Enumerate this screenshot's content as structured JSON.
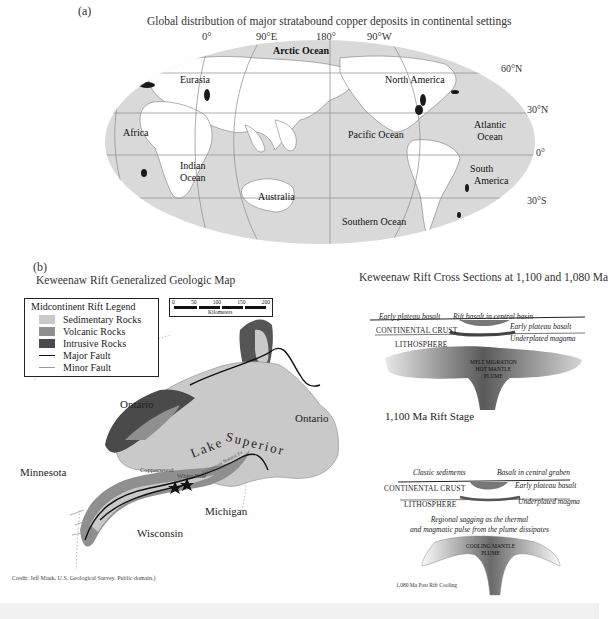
{
  "panel_a": {
    "label": "(a)",
    "title": "Global distribution of major stratabound copper deposits in continental settings",
    "longitudes": [
      "0°",
      "90°E",
      "180°",
      "90°W"
    ],
    "latitudes": [
      "60°N",
      "30°N",
      "0°",
      "30°S"
    ],
    "places": {
      "arctic": "Arctic Ocean",
      "eurasia": "Eurasia",
      "north_america": "North America",
      "africa": "Africa",
      "pacific": "Pacific Ocean",
      "atlantic_1": "Atlantic",
      "atlantic_2": "Ocean",
      "indian_1": "Indian",
      "indian_2": "Ocean",
      "south_america_1": "South",
      "south_america_2": "America",
      "australia": "Australia",
      "southern": "Southern Ocean"
    },
    "colors": {
      "ocean": "#d9d9d9",
      "land": "#ffffff",
      "deposit": "#1a1a1a",
      "graticule": "#8a8a8a"
    }
  },
  "panel_b": {
    "label": "(b)",
    "map_title": "Keweenaw Rift Generalized Geologic Map",
    "legend": {
      "title": "Midcontinent Rift Legend",
      "items": [
        {
          "label": "Sedimentary Rocks",
          "color": "#c9c9c9"
        },
        {
          "label": "Volcanic Rocks",
          "color": "#8f8f8f"
        },
        {
          "label": "Intrusive Rocks",
          "color": "#4a4a4a"
        },
        {
          "label": "Major Fault",
          "color": "#111111"
        },
        {
          "label": "Minor Fault",
          "color": "#9a9a9a"
        }
      ]
    },
    "scale": {
      "ticks": [
        "0",
        "50",
        "100",
        "150",
        "200"
      ],
      "unit": "Kilometers"
    },
    "places": {
      "ontario_w": "Ontario",
      "ontario_e": "Ontario",
      "minnesota": "Minnesota",
      "lake": "Lake",
      "superior": "Superior",
      "michigan": "Michigan",
      "wisconsin": "Wisconsin",
      "copperwood": "Copperwood",
      "white_pine": "White Pine",
      "keweenaw": "Keweenaw Natural Fa"
    },
    "credit": "Credit: Jeff Mauk, U.S. Geological Survey. Public domain.)",
    "sections_title": "Keweenaw Rift Cross Sections at 1,100 and 1,080 Ma",
    "section_1100": {
      "labels": {
        "early_plateau_left": "Early plateau basalt",
        "rift_basalt": "Rift basalt in central basin",
        "continental_crust": "CONTINENTAL CRUST",
        "early_plateau_right": "Early plateau basalt",
        "underplated": "Underplated magama",
        "lithosphere": "LITHOSPHERE",
        "plume_1": "MELT MIGRATION",
        "plume_2": "HOT MANTLE",
        "plume_3": "PLUME"
      },
      "stage": "1,100 Ma Rift Stage"
    },
    "section_1080": {
      "labels": {
        "clastic": "Clastic sediments",
        "basalt_graben": "Basalt in central graben",
        "continental_crust": "CONTINENTAL CRUST",
        "early_plateau": "Early plateau basalt",
        "lithosphere": "LITHOSPHERE",
        "underplated": "Underplated magma",
        "sagging_1": "Regional sagging as the thermal",
        "sagging_2": "and magmatic pulse from the plume dissipates",
        "plume_1": "COOLING MANTLE",
        "plume_2": "PLUME"
      },
      "stage": "1,080 Ma Post Rift Cooling"
    }
  }
}
